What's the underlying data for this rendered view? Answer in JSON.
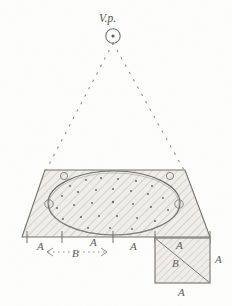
{
  "drawing": {
    "title": "Perspective construction: circle in a square",
    "vanishing_point": {
      "label": "V.p.",
      "x": 113,
      "y": 36,
      "marker": "circled-dot"
    },
    "horizon_line": {
      "name": "horizon-line",
      "x1": 18,
      "y1": 36,
      "x2": 182,
      "y2": 36
    },
    "ground_line": {
      "name": "ground-line",
      "x1": 4,
      "y1": 237,
      "x2": 228,
      "y2": 237
    },
    "convergence_lines": [
      {
        "name": "convergence-line-left",
        "from_x": 113,
        "from_y": 36,
        "to_x": 45,
        "to_y": 170
      },
      {
        "name": "convergence-line-center",
        "from_x": 113,
        "from_y": 36,
        "to_x": 113,
        "to_y": 237
      },
      {
        "name": "convergence-line-right",
        "from_x": 113,
        "from_y": 36,
        "to_x": 185,
        "to_y": 170
      }
    ],
    "trapezoid": {
      "name": "perspective-square-trapezoid",
      "top_left_x": 45,
      "top_right_x": 185,
      "top_y": 170,
      "bottom_left_x": 22,
      "bottom_right_x": 210,
      "bottom_y": 237,
      "hatched": true
    },
    "ellipse": {
      "name": "inscribed-ellipse",
      "cx": 114,
      "cy": 203,
      "rx": 66,
      "ry": 32,
      "note": "circle drawn in perspective, tangent to trapezoid sides"
    },
    "tangent_markers": [
      {
        "name": "tangent-point-left",
        "x": 49,
        "y": 204
      },
      {
        "name": "tangent-point-right",
        "x": 179,
        "y": 204
      },
      {
        "name": "tangent-point-top",
        "x": 113,
        "y": 172
      },
      {
        "name": "tangent-point-bottom",
        "x": 113,
        "y": 235
      }
    ],
    "square": {
      "name": "true-shape-square",
      "x": 155,
      "y": 238,
      "width": 55,
      "height": 45,
      "hatched": true,
      "diagonal_label": "B",
      "side_labels": {
        "top": "A",
        "right": "A",
        "bottom": "A"
      }
    },
    "baseline_ticks": [
      27,
      62,
      113,
      155,
      210
    ],
    "dimension_arrow": {
      "name": "dimension-arrow-b",
      "label": "B",
      "x1": 46,
      "x2": 108,
      "y": 253
    },
    "labels": [
      {
        "name": "label-a-1",
        "text": "A",
        "x": 37,
        "y": 240
      },
      {
        "name": "label-a-2",
        "text": "A",
        "x": 90,
        "y": 236
      },
      {
        "name": "label-a-3",
        "text": "A",
        "x": 130,
        "y": 240
      },
      {
        "name": "label-a-4",
        "text": "A",
        "x": 176,
        "y": 239
      },
      {
        "name": "label-b-baseline",
        "text": "B",
        "x": 72,
        "y": 250
      },
      {
        "name": "label-a-square-right",
        "text": "A",
        "x": 215,
        "y": 253
      },
      {
        "name": "label-b-diagonal",
        "text": "B",
        "x": 172,
        "y": 258
      },
      {
        "name": "label-a-square-bottom",
        "text": "A",
        "x": 178,
        "y": 288
      }
    ],
    "colors": {
      "ink": "#6a6963",
      "ink_light": "#9b9a94",
      "hatch": "#a9a8a1",
      "fill": "#eceae4",
      "paper": "#fdfdfc"
    }
  }
}
